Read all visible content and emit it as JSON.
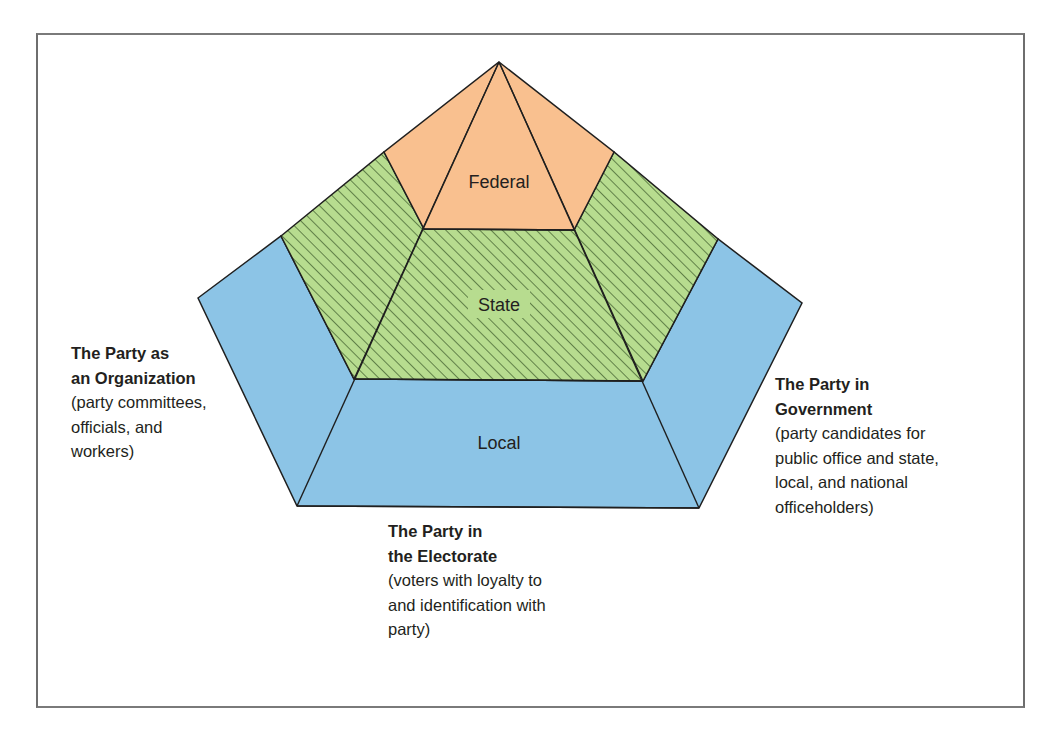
{
  "diagram": {
    "type": "pentagon-pyramid",
    "colors": {
      "federal": "#f9c08f",
      "state": "#b7dc8f",
      "state_hatch": "#3c5a2a",
      "local": "#8cc4e6",
      "outline": "#1f1f1f",
      "frame": "#6e6e6e"
    },
    "levels": [
      {
        "id": "federal",
        "label": "Federal"
      },
      {
        "id": "state",
        "label": "State"
      },
      {
        "id": "local",
        "label": "Local"
      }
    ]
  },
  "captions": {
    "organization": {
      "title_lines": [
        "The Party as",
        "an Organization"
      ],
      "desc_lines": [
        "(party committees,",
        "officials, and",
        "workers)"
      ]
    },
    "government": {
      "title_lines": [
        "The Party in",
        "Government"
      ],
      "desc_lines": [
        "(party candidates for",
        "public office and state,",
        "local, and national",
        "officeholders)"
      ]
    },
    "electorate": {
      "title_lines": [
        "The Party in",
        "the Electorate"
      ],
      "desc_lines": [
        "(voters with loyalty to",
        "and identification with",
        "party)"
      ]
    }
  }
}
